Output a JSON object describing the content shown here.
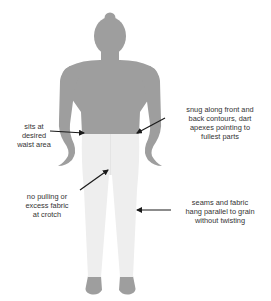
{
  "colors": {
    "body": "#9e9e9e",
    "pants": "#eeeeee",
    "pants_shade": "#e6e6e6",
    "arrow": "#1a1a1a",
    "text": "#333333",
    "background": "#ffffff"
  },
  "annotations": [
    {
      "id": "waist",
      "lines": [
        "sits at",
        "desired",
        "waist area"
      ]
    },
    {
      "id": "darts",
      "lines": [
        "snug along front and",
        "back contours, dart",
        "apexes pointing to",
        "fullest parts"
      ]
    },
    {
      "id": "crotch",
      "lines": [
        "no pulling or",
        "excess fabric",
        "at crotch"
      ]
    },
    {
      "id": "grain",
      "lines": [
        "seams and fabric",
        "hang parallel to grain",
        "without twisting"
      ]
    }
  ]
}
